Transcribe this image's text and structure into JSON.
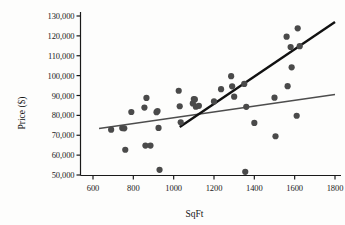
{
  "chart_data": {
    "type": "scatter",
    "title": "",
    "xlabel": "SqFt",
    "ylabel": "Price ($)",
    "xlim": [
      500,
      1850
    ],
    "ylim": [
      45000,
      133000
    ],
    "grid": false,
    "legend": false,
    "xticks": [
      600,
      800,
      1000,
      1200,
      1400,
      1600,
      1800
    ],
    "xtick_labels": [
      "600",
      "800",
      "1000",
      "1200",
      "1400",
      "1600",
      "1800"
    ],
    "yticks": [
      50000,
      60000,
      70000,
      80000,
      90000,
      100000,
      110000,
      120000,
      130000
    ],
    "ytick_labels": [
      "50,000",
      "60,000",
      "70,000",
      "80,000",
      "90,000",
      "100,000",
      "110,000",
      "120,000",
      "130,000"
    ],
    "marker_color": "#4a4a4a",
    "marker_size": 3.1,
    "points": [
      {
        "x": 690,
        "y": 72800
      },
      {
        "x": 745,
        "y": 73600
      },
      {
        "x": 755,
        "y": 73500
      },
      {
        "x": 760,
        "y": 62700
      },
      {
        "x": 790,
        "y": 81700
      },
      {
        "x": 855,
        "y": 83900
      },
      {
        "x": 860,
        "y": 64800
      },
      {
        "x": 865,
        "y": 88800
      },
      {
        "x": 885,
        "y": 64800
      },
      {
        "x": 915,
        "y": 81600
      },
      {
        "x": 920,
        "y": 82200
      },
      {
        "x": 925,
        "y": 73700
      },
      {
        "x": 930,
        "y": 52600
      },
      {
        "x": 1025,
        "y": 92400
      },
      {
        "x": 1030,
        "y": 84600
      },
      {
        "x": 1035,
        "y": 76500
      },
      {
        "x": 1095,
        "y": 86000
      },
      {
        "x": 1100,
        "y": 88200
      },
      {
        "x": 1105,
        "y": 88000
      },
      {
        "x": 1110,
        "y": 84400
      },
      {
        "x": 1125,
        "y": 84800
      },
      {
        "x": 1200,
        "y": 87000
      },
      {
        "x": 1235,
        "y": 93200
      },
      {
        "x": 1285,
        "y": 99700
      },
      {
        "x": 1290,
        "y": 94600
      },
      {
        "x": 1300,
        "y": 89400
      },
      {
        "x": 1350,
        "y": 95800
      },
      {
        "x": 1355,
        "y": 51600
      },
      {
        "x": 1360,
        "y": 84300
      },
      {
        "x": 1400,
        "y": 76200
      },
      {
        "x": 1500,
        "y": 88900
      },
      {
        "x": 1505,
        "y": 69500
      },
      {
        "x": 1560,
        "y": 119600
      },
      {
        "x": 1565,
        "y": 94700
      },
      {
        "x": 1580,
        "y": 114400
      },
      {
        "x": 1585,
        "y": 104200
      },
      {
        "x": 1610,
        "y": 79800
      },
      {
        "x": 1615,
        "y": 123800
      },
      {
        "x": 1625,
        "y": 114800
      }
    ],
    "lines": [
      {
        "name": "steep-fit-line",
        "color": "#111111",
        "width": 2.4,
        "x0": 1030,
        "y0": 74100,
        "x1": 1800,
        "y1": 127000
      },
      {
        "name": "shallow-fit-line",
        "color": "#4d4d4d",
        "width": 1.5,
        "x0": 630,
        "y0": 73400,
        "x1": 1800,
        "y1": 90500
      }
    ],
    "axis_color": "#1a1a1a",
    "background": "#fdfdfc"
  }
}
